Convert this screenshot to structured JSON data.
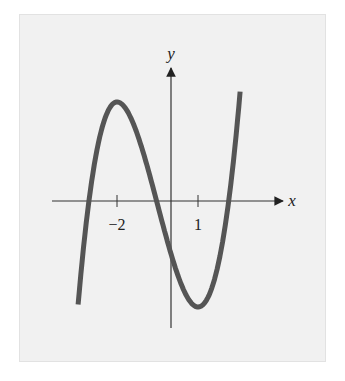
{
  "chart_data": {
    "type": "line",
    "title": "",
    "xlabel": "x",
    "ylabel": "y",
    "x_ticks": [
      {
        "value": -2,
        "label": "−2"
      },
      {
        "value": 1,
        "label": "1"
      }
    ],
    "y_ticks": [],
    "grid": false,
    "legend": null,
    "series": [
      {
        "name": "f(x)",
        "color": "#555555",
        "critical_points": [
          {
            "x": -2,
            "type": "local maximum"
          },
          {
            "x": 1,
            "type": "local minimum"
          }
        ],
        "approx_roots": [
          -3.15,
          -0.4,
          2.15
        ],
        "x_range": [
          -3.44,
          2.56
        ]
      }
    ]
  },
  "labels": {
    "x_axis": "x",
    "y_axis": "y",
    "tick_neg2": "−2",
    "tick_1": "1"
  },
  "colors": {
    "background": "#f1f1f1",
    "axis": "#333333",
    "curve": "#555555"
  }
}
